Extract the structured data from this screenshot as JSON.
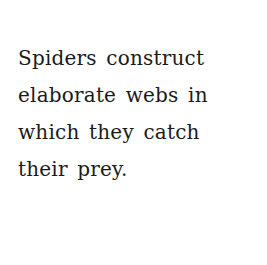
{
  "caption": {
    "lines": [
      "Spiders construct",
      "elaborate webs in",
      "which they catch",
      "their prey."
    ]
  }
}
